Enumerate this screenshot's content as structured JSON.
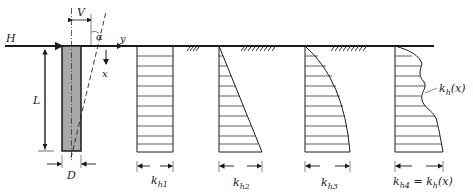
{
  "diagram": {
    "type": "pile lateral subgrade reaction distributions",
    "pile_labels": {
      "horizontal_load": "H",
      "vertical_offset": "V",
      "angle": "α",
      "axis_y": "y",
      "axis_x": "x",
      "length": "L",
      "diameter": "D"
    },
    "distributions": [
      {
        "id": "kh1",
        "shape": "uniform",
        "label_main": "k",
        "label_sub": "h1"
      },
      {
        "id": "kh2",
        "shape": "linear-increasing",
        "label_main": "k",
        "label_sub": "h2"
      },
      {
        "id": "kh3",
        "shape": "parabolic",
        "label_main": "k",
        "label_sub": "h3"
      },
      {
        "id": "kh4",
        "shape": "arbitrary",
        "label_main": "k",
        "label_sub": "h4",
        "label_suffix": " = k",
        "label_suffix_sub": "h",
        "label_tail": "(x)"
      }
    ],
    "curve_annotation": {
      "main": "k",
      "sub": "h",
      "tail": "(x)"
    },
    "colors": {
      "line": "#1a1a1a",
      "pile_fill": "#a8a8a8",
      "background": "#ffffff"
    }
  }
}
